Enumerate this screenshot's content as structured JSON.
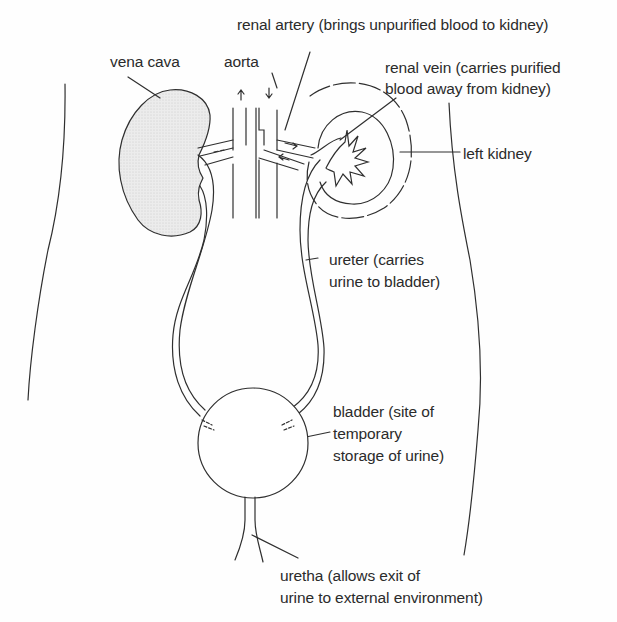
{
  "diagram": {
    "colors": {
      "background": "#fefefe",
      "ink": "#2b2b2b",
      "kidney_fill": "#e9e9e9"
    },
    "labels": {
      "renal_artery": "renal artery (brings unpurified blood to kidney)",
      "vena_cava": "vena cava",
      "aorta": "aorta",
      "renal_vein_line1": "renal vein (carries purified",
      "renal_vein_line2": "blood away from kidney)",
      "left_kidney": "left kidney",
      "ureter_line1": "ureter (carries",
      "ureter_line2": "urine to bladder)",
      "bladder_line1": "bladder (site of",
      "bladder_line2": "temporary",
      "bladder_line3": "storage of urine)",
      "uretha_line1": "uretha (allows exit of",
      "uretha_line2": "urine to external environment)"
    },
    "structures": [
      "body-outline-left",
      "body-outline-right",
      "right-kidney",
      "left-kidney",
      "vena-cava",
      "aorta",
      "renal-artery",
      "renal-vein",
      "ureters",
      "bladder",
      "uretha"
    ]
  }
}
